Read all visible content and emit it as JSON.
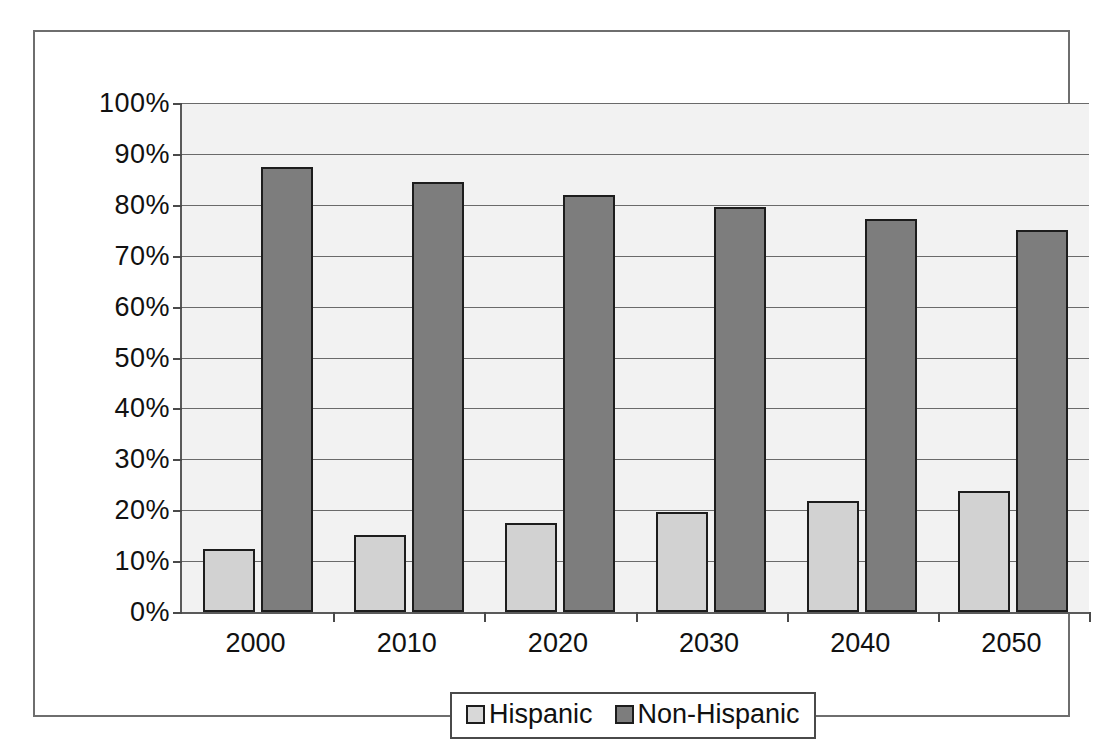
{
  "chart_data": {
    "type": "bar",
    "title": "",
    "xlabel": "",
    "ylabel": "",
    "categories": [
      "2000",
      "2010",
      "2020",
      "2030",
      "2040",
      "2050"
    ],
    "series": [
      {
        "name": "Hispanic",
        "color": "#d2d2d2",
        "values": [
          12.3,
          15.2,
          17.4,
          19.6,
          21.8,
          23.8
        ]
      },
      {
        "name": "Non-Hispanic",
        "color": "#7d7d7d",
        "values": [
          87.5,
          84.5,
          82.0,
          79.5,
          77.3,
          75.0
        ]
      }
    ],
    "ylim": [
      0,
      100
    ],
    "yticks": [
      0,
      10,
      20,
      30,
      40,
      50,
      60,
      70,
      80,
      90,
      100
    ],
    "ytick_labels": [
      "0%",
      "10%",
      "20%",
      "30%",
      "40%",
      "50%",
      "60%",
      "70%",
      "80%",
      "90%",
      "100%"
    ],
    "grid": true,
    "legend_position": "bottom",
    "legend": [
      {
        "label": "Hispanic",
        "swatch": "#d8d8d8"
      },
      {
        "label": "Non-Hispanic",
        "swatch": "#7d7d7d"
      }
    ],
    "plot_background": "#f2f2f2",
    "axis_color": "#5a5a5a",
    "frame_color": "#6e6e6e"
  }
}
